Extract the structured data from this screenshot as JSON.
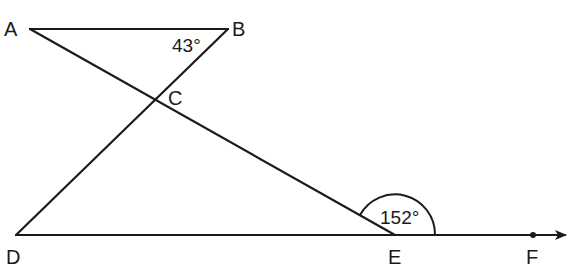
{
  "diagram": {
    "type": "geometry",
    "points": {
      "A": {
        "label": "A",
        "x": 30,
        "y": 29
      },
      "B": {
        "label": "B",
        "x": 228,
        "y": 29
      },
      "C": {
        "label": "C",
        "x": 155,
        "y": 99
      },
      "D": {
        "label": "D",
        "x": 16,
        "y": 235
      },
      "E": {
        "label": "E",
        "x": 395,
        "y": 235
      },
      "F": {
        "label": "F",
        "x": 533,
        "y": 235
      }
    },
    "segments": [
      {
        "from": "A",
        "to": "B"
      },
      {
        "from": "B",
        "to": "D"
      },
      {
        "from": "A",
        "to": "E"
      },
      {
        "from": "D",
        "to": "F",
        "arrow": true
      }
    ],
    "angles": [
      {
        "vertex": "B",
        "value": "43°"
      },
      {
        "vertex": "E",
        "value": "152°"
      }
    ],
    "colors": {
      "stroke": "#1a1a1a",
      "background": "#ffffff"
    }
  }
}
